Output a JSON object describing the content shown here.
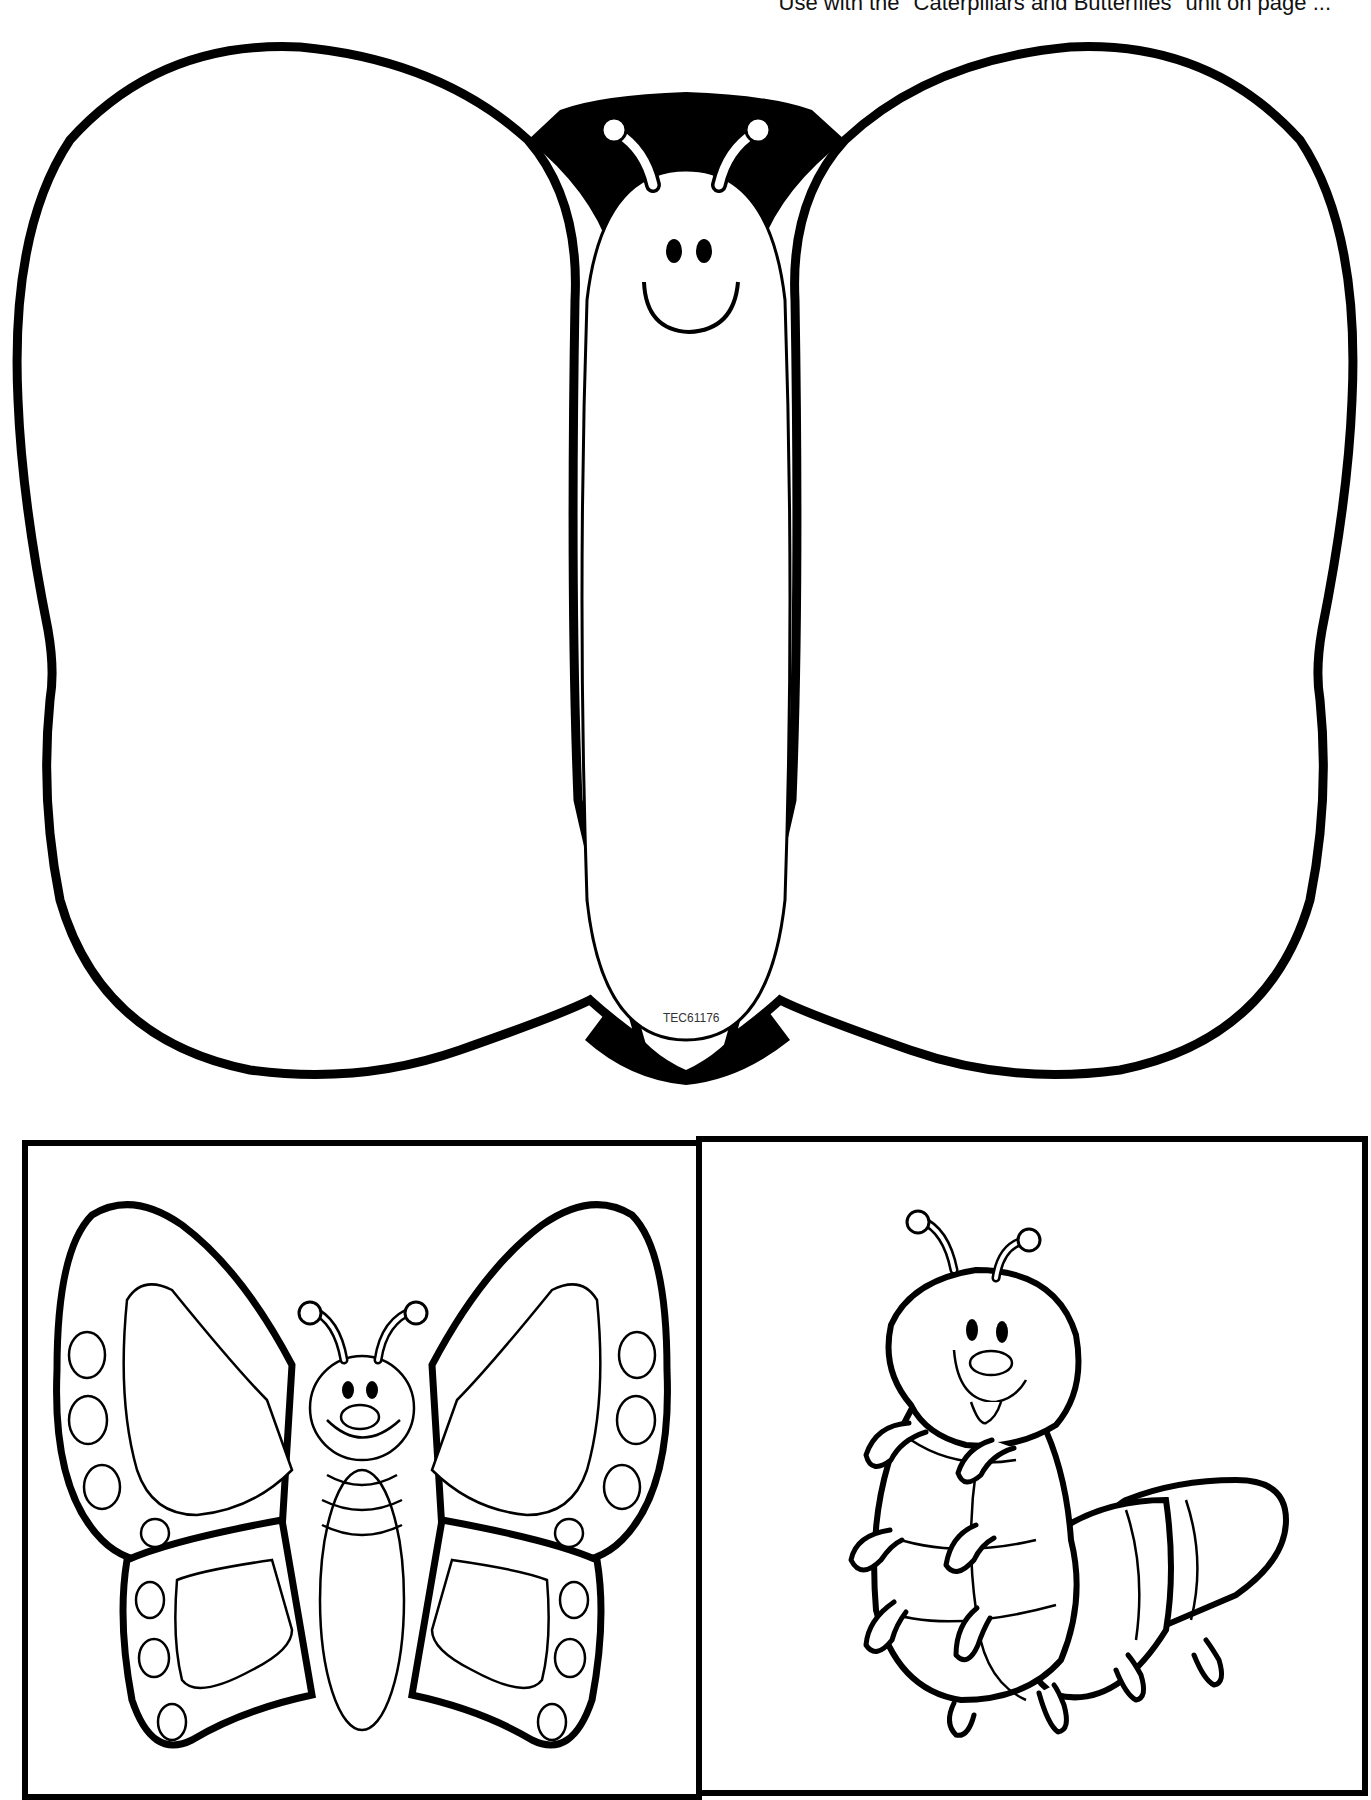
{
  "header": {
    "note": "Use with the \"Caterpillars and Butterflies\" unit on page ..."
  },
  "main_butterfly": {
    "code_label": "TEC61176",
    "ink_color": "#000000",
    "paper_color": "#ffffff"
  },
  "cards": [
    {
      "subject": "butterfly"
    },
    {
      "subject": "caterpillar"
    }
  ]
}
